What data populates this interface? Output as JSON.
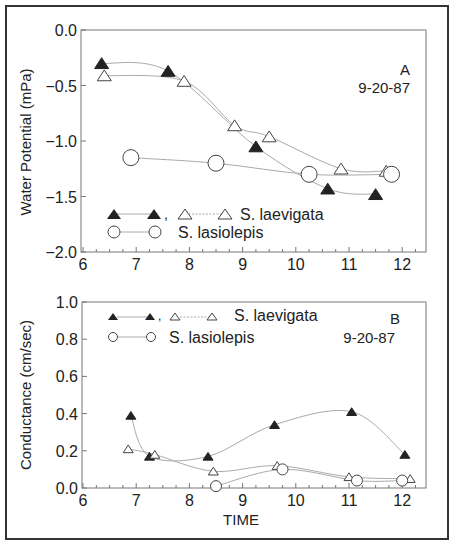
{
  "chart_data": [
    {
      "panel": "A",
      "type": "line",
      "date_label": "9-20-87",
      "panel_label": "A",
      "xlabel": "",
      "ylabel": "Water Potential (mPa)",
      "xlim": [
        6,
        12.45
      ],
      "ylim": [
        -2.0,
        0.0
      ],
      "xticks": [
        6,
        7,
        8,
        9,
        10,
        11,
        12
      ],
      "yticks": [
        0.0,
        -0.5,
        -1.0,
        -1.5,
        -2.0
      ],
      "ytick_labels": [
        "0.0",
        "−0.5",
        "−1.0",
        "−1.5",
        "−2.0"
      ],
      "grid": false,
      "legend": {
        "position": "lower left",
        "entries": [
          {
            "label": "S. laevigata",
            "markers": [
              "filled-triangle",
              "open-triangle"
            ]
          },
          {
            "label": "S. lasiolepis",
            "markers": [
              "open-circle"
            ]
          }
        ]
      },
      "series": [
        {
          "name": "S. laevigata (filled)",
          "marker": "filled-triangle",
          "x": [
            6.35,
            7.6,
            9.25,
            10.6,
            11.5
          ],
          "y": [
            -0.3,
            -0.37,
            -1.05,
            -1.43,
            -1.48
          ]
        },
        {
          "name": "S. laevigata (open)",
          "marker": "open-triangle",
          "x": [
            6.4,
            7.9,
            8.85,
            9.5,
            10.85,
            11.7
          ],
          "y": [
            -0.41,
            -0.46,
            -0.86,
            -0.96,
            -1.25,
            -1.27
          ]
        },
        {
          "name": "S. lasiolepis",
          "marker": "open-circle",
          "x": [
            6.9,
            8.5,
            10.25,
            11.8
          ],
          "y": [
            -1.15,
            -1.2,
            -1.3,
            -1.3
          ]
        }
      ]
    },
    {
      "panel": "B",
      "type": "line",
      "date_label": "9-20-87",
      "panel_label": "B",
      "xlabel": "TIME",
      "ylabel": "Conductance (cm/sec)",
      "xlim": [
        6,
        12.45
      ],
      "ylim": [
        0.0,
        1.0
      ],
      "xticks": [
        6,
        7,
        8,
        9,
        10,
        11,
        12
      ],
      "yticks": [
        0.0,
        0.2,
        0.4,
        0.6,
        0.8,
        1.0
      ],
      "ytick_labels": [
        "0.0",
        "0.2",
        "0.4",
        "0.6",
        "0.8",
        "1.0"
      ],
      "grid": false,
      "legend": {
        "position": "upper left",
        "entries": [
          {
            "label": "S. laevigata",
            "markers": [
              "filled-triangle",
              "open-triangle"
            ]
          },
          {
            "label": "S. lasiolepis",
            "markers": [
              "open-circle"
            ]
          }
        ]
      },
      "series": [
        {
          "name": "S. laevigata (filled)",
          "marker": "filled-triangle",
          "x": [
            6.9,
            7.25,
            8.35,
            9.6,
            11.05,
            12.05
          ],
          "y": [
            0.39,
            0.17,
            0.17,
            0.34,
            0.41,
            0.18
          ]
        },
        {
          "name": "S. laevigata (open)",
          "marker": "open-triangle",
          "x": [
            6.85,
            7.35,
            8.45,
            9.65,
            11.0,
            12.15
          ],
          "y": [
            0.21,
            0.18,
            0.09,
            0.12,
            0.06,
            0.05
          ]
        },
        {
          "name": "S. lasiolepis",
          "marker": "open-circle",
          "x": [
            8.5,
            9.75,
            11.15,
            12.0
          ],
          "y": [
            0.01,
            0.1,
            0.04,
            0.04
          ]
        }
      ]
    }
  ],
  "labels": {
    "panelA": {
      "letter": "A",
      "date": "9-20-87",
      "ylabel": "Water Potential (mPa)",
      "legend1": "S. laevigata",
      "legend2": "S. lasiolepis",
      "comma": ","
    },
    "panelB": {
      "letter": "B",
      "date": "9-20-87",
      "ylabel": "Conductance (cm/sec)",
      "legend1": "S. laevigata",
      "legend2": "S. lasiolepis",
      "comma": ",",
      "xlabel": "TIME"
    }
  },
  "colors": {
    "axis": "#555555",
    "line": "#aaaaaa",
    "marker": "#222222",
    "frame": "#333333"
  }
}
